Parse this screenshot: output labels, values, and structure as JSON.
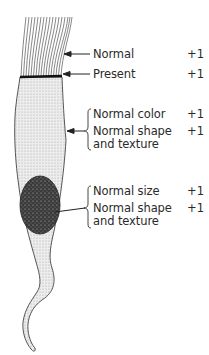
{
  "diagram": {
    "parts": [
      "cilia",
      "terminal plate",
      "cytoplasm",
      "nucleus"
    ]
  },
  "labels": [
    {
      "part": "cilia",
      "text": "Normal",
      "score": "+1"
    },
    {
      "part": "terminal plate",
      "text": "Present",
      "score": "+1"
    },
    {
      "part": "cytoplasm",
      "items": [
        {
          "text": "Normal color",
          "score": "+1"
        },
        {
          "text": "Normal shape",
          "text2": "and texture",
          "score": "+1"
        }
      ]
    },
    {
      "part": "nucleus",
      "items": [
        {
          "text": "Normal size",
          "score": "+1"
        },
        {
          "text": "Normal shape",
          "text2": "and texture",
          "score": "+1"
        }
      ]
    }
  ],
  "colors": {
    "ink": "#2a2a2a",
    "cytoplasm": "#e4e4e4",
    "nucleus": "#3a3a3a"
  }
}
